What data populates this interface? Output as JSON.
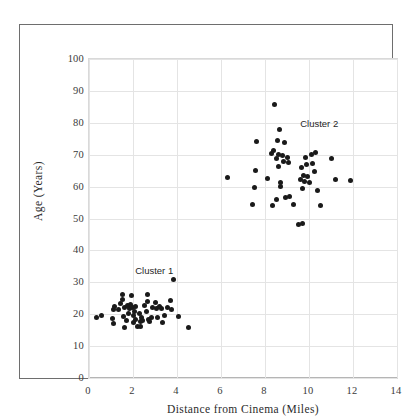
{
  "chart_data": {
    "type": "scatter",
    "title": "",
    "xlabel": "Distance from Cinema (Miles)",
    "ylabel": "Age (Years)",
    "xlim": [
      0,
      14
    ],
    "ylim": [
      0,
      100
    ],
    "xticks": [
      0,
      2,
      4,
      6,
      8,
      10,
      12,
      14
    ],
    "yticks": [
      0,
      10,
      20,
      30,
      40,
      50,
      60,
      70,
      80,
      90,
      100
    ],
    "grid": true,
    "legend": "none",
    "point_color": "#1a1a1a",
    "annotations": [
      {
        "text": "Cluster 1",
        "x": 2.1,
        "y": 35.5
      },
      {
        "text": "Cluster 2",
        "x": 9.6,
        "y": 81.5
      }
    ],
    "series": [
      {
        "name": "Cluster 1",
        "points": [
          [
            0.35,
            19.0
          ],
          [
            0.55,
            19.5
          ],
          [
            1.05,
            18.6
          ],
          [
            1.1,
            17.2
          ],
          [
            1.12,
            21.5
          ],
          [
            1.15,
            22.4
          ],
          [
            1.35,
            21.6
          ],
          [
            1.45,
            23.3
          ],
          [
            1.5,
            26.3
          ],
          [
            1.52,
            24.6
          ],
          [
            1.55,
            19.3
          ],
          [
            1.6,
            22.2
          ],
          [
            1.62,
            15.8
          ],
          [
            1.7,
            17.9
          ],
          [
            1.75,
            22.6
          ],
          [
            1.8,
            20.3
          ],
          [
            1.85,
            21.8
          ],
          [
            1.9,
            23.0
          ],
          [
            1.95,
            25.9
          ],
          [
            1.98,
            22.1
          ],
          [
            2.0,
            19.6
          ],
          [
            2.02,
            17.4
          ],
          [
            2.05,
            20.7
          ],
          [
            2.1,
            22.3
          ],
          [
            2.12,
            18.2
          ],
          [
            2.2,
            16.0
          ],
          [
            2.3,
            20.2
          ],
          [
            2.32,
            17.8
          ],
          [
            2.35,
            16.2
          ],
          [
            2.4,
            19.1
          ],
          [
            2.45,
            18.0
          ],
          [
            2.5,
            22.8
          ],
          [
            2.6,
            21.0
          ],
          [
            2.65,
            24.0
          ],
          [
            2.68,
            26.3
          ],
          [
            2.7,
            18.3
          ],
          [
            2.75,
            17.6
          ],
          [
            2.85,
            19.0
          ],
          [
            2.9,
            22.2
          ],
          [
            3.0,
            23.8
          ],
          [
            3.05,
            21.8
          ],
          [
            3.1,
            18.9
          ],
          [
            3.2,
            22.4
          ],
          [
            3.3,
            21.9
          ],
          [
            3.35,
            17.4
          ],
          [
            3.45,
            19.7
          ],
          [
            3.55,
            22.2
          ],
          [
            3.7,
            24.2
          ],
          [
            3.75,
            21.4
          ],
          [
            3.85,
            30.9
          ],
          [
            4.05,
            19.4
          ],
          [
            4.5,
            15.9
          ]
        ]
      },
      {
        "name": "Cluster 2",
        "points": [
          [
            6.3,
            62.9
          ],
          [
            7.45,
            54.4
          ],
          [
            7.5,
            59.6
          ],
          [
            7.55,
            64.9
          ],
          [
            7.6,
            74.1
          ],
          [
            8.1,
            62.5
          ],
          [
            8.3,
            70.4
          ],
          [
            8.35,
            54.0
          ],
          [
            8.4,
            71.3
          ],
          [
            8.45,
            85.7
          ],
          [
            8.5,
            68.9
          ],
          [
            8.5,
            55.9
          ],
          [
            8.55,
            74.5
          ],
          [
            8.6,
            66.4
          ],
          [
            8.62,
            70.0
          ],
          [
            8.65,
            77.8
          ],
          [
            8.7,
            60.1
          ],
          [
            8.72,
            61.3
          ],
          [
            8.8,
            69.7
          ],
          [
            8.85,
            67.8
          ],
          [
            8.9,
            73.7
          ],
          [
            8.95,
            56.6
          ],
          [
            9.0,
            69.1
          ],
          [
            9.05,
            67.5
          ],
          [
            9.1,
            56.9
          ],
          [
            9.3,
            54.5
          ],
          [
            9.5,
            48.1
          ],
          [
            9.6,
            62.1
          ],
          [
            9.65,
            66.1
          ],
          [
            9.7,
            59.5
          ],
          [
            9.72,
            48.4
          ],
          [
            9.75,
            63.5
          ],
          [
            9.8,
            61.6
          ],
          [
            9.85,
            69.2
          ],
          [
            9.9,
            66.9
          ],
          [
            9.95,
            63.3
          ],
          [
            10.0,
            61.3
          ],
          [
            10.1,
            70.2
          ],
          [
            10.15,
            67.2
          ],
          [
            10.25,
            64.6
          ],
          [
            10.3,
            70.6
          ],
          [
            10.4,
            58.7
          ],
          [
            10.5,
            54.0
          ],
          [
            11.0,
            68.7
          ],
          [
            11.2,
            62.1
          ],
          [
            11.9,
            61.9
          ]
        ]
      }
    ]
  }
}
